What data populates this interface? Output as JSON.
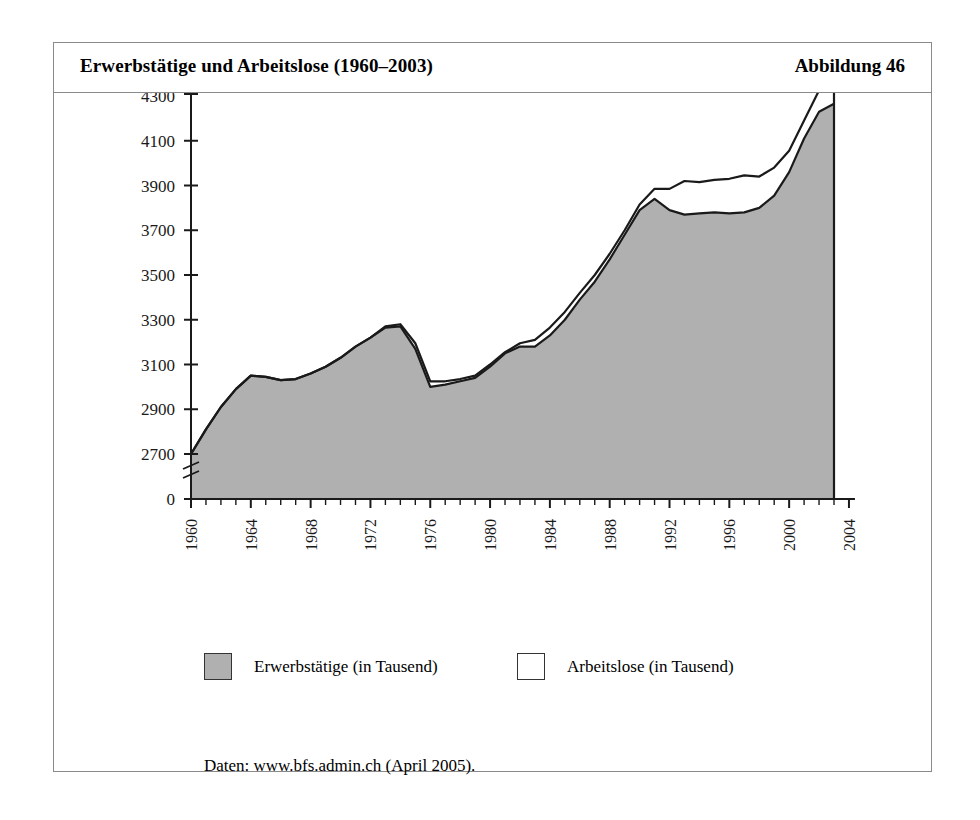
{
  "figure": {
    "title": "Erwerbstätige und Arbeitslose (1960–2003)",
    "number_label": "Abbildung 46",
    "source_note": "Daten: www.bfs.admin.ch (April 2005)."
  },
  "legend": {
    "position": "bottom",
    "items": [
      {
        "label": "Erwerbstätige (in Tausend)",
        "swatch": "filled",
        "color": "#b0b0b0"
      },
      {
        "label": "Arbeitslose (in Tausend)",
        "swatch": "empty",
        "color": "#ffffff"
      }
    ]
  },
  "colors": {
    "area_fill": "#b0b0b0",
    "line": "#1a1a1a",
    "frame": "#8a8a8a",
    "background": "#ffffff"
  },
  "chart_data": {
    "type": "area",
    "title": "Erwerbstätige und Arbeitslose (1960–2003)",
    "xlabel": "",
    "ylabel": "",
    "grid": false,
    "legend_position": "bottom",
    "axis_break": true,
    "axis_break_note": "y-axis broken between 0 and 2700",
    "xlim": [
      1960,
      2004
    ],
    "ylim": [
      2600,
      4340
    ],
    "ytick_labels": [
      "0",
      "2700",
      "2900",
      "3100",
      "3300",
      "3500",
      "3700",
      "3900",
      "4100",
      "4300"
    ],
    "yticks": [
      0,
      2700,
      2900,
      3100,
      3300,
      3500,
      3700,
      3900,
      4100,
      4300
    ],
    "xtick_labels": [
      "1960",
      "1964",
      "1968",
      "1972",
      "1976",
      "1980",
      "1984",
      "1988",
      "1992",
      "1996",
      "2000",
      "2004"
    ],
    "xticks": [
      1960,
      1964,
      1968,
      1972,
      1976,
      1980,
      1984,
      1988,
      1992,
      1996,
      2000,
      2004
    ],
    "x": [
      1960,
      1961,
      1962,
      1963,
      1964,
      1965,
      1966,
      1967,
      1968,
      1969,
      1970,
      1971,
      1972,
      1973,
      1974,
      1975,
      1976,
      1977,
      1978,
      1979,
      1980,
      1981,
      1982,
      1983,
      1984,
      1985,
      1986,
      1987,
      1988,
      1989,
      1990,
      1991,
      1992,
      1993,
      1994,
      1995,
      1996,
      1997,
      1998,
      1999,
      2000,
      2001,
      2002,
      2003
    ],
    "series": [
      {
        "name": "Erwerbstätige (in Tausend)",
        "stacked": true,
        "fill": "#b0b0b0",
        "values": [
          2700,
          2810,
          2910,
          2990,
          3050,
          3045,
          3030,
          3035,
          3060,
          3090,
          3130,
          3180,
          3220,
          3265,
          3270,
          3170,
          3000,
          3010,
          3025,
          3040,
          3090,
          3150,
          3180,
          3180,
          3230,
          3300,
          3390,
          3470,
          3570,
          3680,
          3790,
          3840,
          3790,
          3770,
          3775,
          3780,
          3775,
          3780,
          3800,
          3855,
          3960,
          4110,
          4230,
          4265
        ]
      },
      {
        "name": "Arbeitslose (in Tausend)",
        "stacked": true,
        "fill": "#ffffff",
        "values": [
          0,
          0,
          0,
          0,
          0,
          0,
          0,
          0,
          0,
          0,
          0,
          0,
          0,
          5,
          10,
          25,
          25,
          15,
          10,
          10,
          10,
          5,
          15,
          30,
          35,
          35,
          30,
          30,
          25,
          20,
          25,
          45,
          95,
          150,
          140,
          145,
          155,
          165,
          140,
          125,
          95,
          80,
          95,
          80
        ]
      }
    ],
    "total_series": {
      "name": "Erwerbstätige + Arbeitslose",
      "values": [
        2700,
        2810,
        2910,
        2990,
        3050,
        3045,
        3030,
        3035,
        3060,
        3090,
        3130,
        3180,
        3220,
        3270,
        3280,
        3195,
        3025,
        3025,
        3035,
        3050,
        3100,
        3155,
        3195,
        3210,
        3265,
        3335,
        3420,
        3500,
        3595,
        3700,
        3815,
        3885,
        3885,
        3920,
        3915,
        3925,
        3930,
        3945,
        3940,
        3980,
        4055,
        4190,
        4325,
        4345
      ]
    },
    "annotations": []
  }
}
